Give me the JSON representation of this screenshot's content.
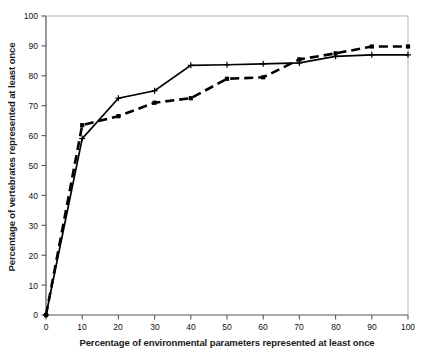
{
  "chart_data": {
    "type": "line",
    "title": "",
    "subtitle": "",
    "xlabel": "Percentage of environmental parameters represented at least once",
    "ylabel": "Percentage of vertebrates represented at least once",
    "xlim": [
      0,
      100
    ],
    "ylim": [
      0,
      100
    ],
    "xticks": [
      0,
      10,
      20,
      30,
      40,
      50,
      60,
      70,
      80,
      90,
      100
    ],
    "yticks": [
      0,
      10,
      20,
      30,
      40,
      50,
      60,
      70,
      80,
      90,
      100
    ],
    "grid": false,
    "legend": "none",
    "x": [
      0,
      10,
      20,
      30,
      40,
      50,
      60,
      70,
      80,
      90,
      100
    ],
    "series": [
      {
        "name": "solid-series",
        "style": "solid",
        "color": "#000000",
        "marker": "plus",
        "values": [
          0,
          59,
          72.5,
          75,
          83.5,
          83.7,
          84,
          84.3,
          86.5,
          87,
          87
        ]
      },
      {
        "name": "dashed-series",
        "style": "dashed",
        "color": "#000000",
        "marker": "square",
        "values": [
          0,
          63.5,
          66.5,
          71,
          72.5,
          79,
          79.5,
          85.5,
          87.5,
          89.8,
          89.8
        ]
      }
    ]
  },
  "axes": {
    "x_tick_labels": [
      "0",
      "10",
      "20",
      "30",
      "40",
      "50",
      "60",
      "70",
      "80",
      "90",
      "100"
    ],
    "y_tick_labels": [
      "0",
      "10",
      "20",
      "30",
      "40",
      "50",
      "60",
      "70",
      "80",
      "90",
      "100"
    ]
  },
  "colors": {
    "axis": "#555555",
    "series": "#000000",
    "background": "#ffffff"
  }
}
